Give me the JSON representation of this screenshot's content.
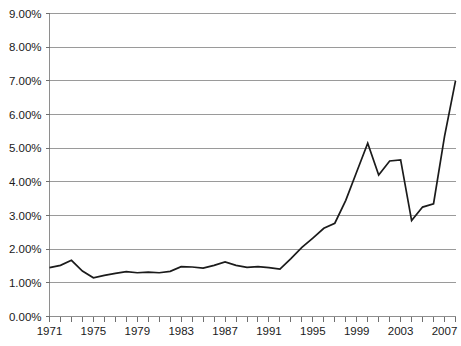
{
  "chart_data": {
    "type": "line",
    "title": "",
    "subtitle": "",
    "xlabel": "",
    "ylabel": "",
    "grid": "horizontal",
    "legend_position": "none",
    "xlim": [
      1971,
      2008
    ],
    "ylim": [
      0,
      9
    ],
    "y_tick_labels": [
      "9.00%",
      "8.00%",
      "7.00%",
      "6.00%",
      "5.00%",
      "4.00%",
      "3.00%",
      "2.00%",
      "1.00%",
      "0.00%"
    ],
    "y_ticks": [
      9,
      8,
      7,
      6,
      5,
      4,
      3,
      2,
      1,
      0
    ],
    "x_tick_labels": [
      "1971",
      "1975",
      "1979",
      "1983",
      "1987",
      "1991",
      "1995",
      "1999",
      "2003",
      "2007"
    ],
    "x_ticks_major": [
      1971,
      1975,
      1979,
      1983,
      1987,
      1991,
      1995,
      1999,
      2003,
      2007
    ],
    "x_ticks_minor": [
      1971,
      1972,
      1973,
      1974,
      1975,
      1976,
      1977,
      1978,
      1979,
      1980,
      1981,
      1982,
      1983,
      1984,
      1985,
      1986,
      1987,
      1988,
      1989,
      1990,
      1991,
      1992,
      1993,
      1994,
      1995,
      1996,
      1997,
      1998,
      1999,
      2000,
      2001,
      2002,
      2003,
      2004,
      2005,
      2006,
      2007,
      2008
    ],
    "value_suffix": "%",
    "series": [
      {
        "name": "series-1",
        "color": "#1b1b1b",
        "x": [
          1971,
          1972,
          1973,
          1974,
          1975,
          1976,
          1977,
          1978,
          1979,
          1980,
          1981,
          1982,
          1983,
          1984,
          1985,
          1986,
          1987,
          1988,
          1989,
          1990,
          1991,
          1992,
          1993,
          1994,
          1995,
          1996,
          1997,
          1998,
          1999,
          2000,
          2001,
          2002,
          2003,
          2004,
          2005,
          2006,
          2007,
          2008
        ],
        "values": [
          1.45,
          1.52,
          1.67,
          1.35,
          1.15,
          1.22,
          1.28,
          1.33,
          1.3,
          1.32,
          1.3,
          1.34,
          1.48,
          1.47,
          1.44,
          1.52,
          1.62,
          1.52,
          1.46,
          1.48,
          1.45,
          1.41,
          1.72,
          2.05,
          2.33,
          2.62,
          2.77,
          3.45,
          4.3,
          5.15,
          4.2,
          4.62,
          4.65,
          2.85,
          3.25,
          3.35,
          5.35,
          7.0
        ]
      }
    ],
    "annotations": []
  },
  "axis": {
    "y_axis_name": "y-axis",
    "x_axis_name": "x-axis"
  }
}
